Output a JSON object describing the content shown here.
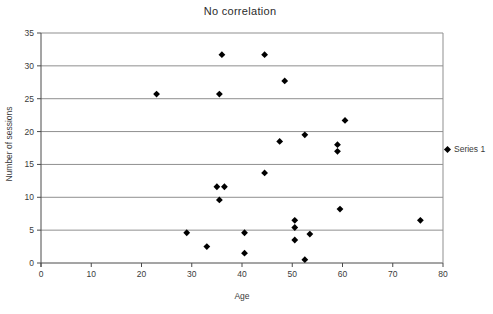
{
  "title": "No correlation",
  "legend": {
    "items": [
      {
        "label": "Series 1",
        "marker": "diamond-icon",
        "color": "#000000"
      }
    ]
  },
  "chart_data": {
    "type": "scatter",
    "title": "No correlation",
    "xlabel": "Age",
    "ylabel": "Number of sessions",
    "xlim": [
      0,
      80
    ],
    "ylim": [
      0,
      35
    ],
    "x_ticks": [
      0,
      10,
      20,
      30,
      40,
      50,
      60,
      70,
      80
    ],
    "y_ticks": [
      0,
      5,
      10,
      15,
      20,
      25,
      30,
      35
    ],
    "grid": "horizontal-gridlines",
    "legend_position": "right",
    "colors": {
      "marker": "#000000",
      "gridline": "#8f8f8f",
      "axis": "#4a4a4a",
      "text": "#3a3a3a",
      "background": "#ffffff"
    },
    "series": [
      {
        "name": "Series 1",
        "marker": "diamond",
        "color": "#000000",
        "points": [
          [
            36,
            31.7
          ],
          [
            44.5,
            31.7
          ],
          [
            48.5,
            27.7
          ],
          [
            23,
            25.7
          ],
          [
            35.5,
            25.7
          ],
          [
            60.5,
            21.7
          ],
          [
            52.5,
            19.5
          ],
          [
            47.5,
            18.5
          ],
          [
            59,
            18
          ],
          [
            59,
            17
          ],
          [
            44.5,
            13.7
          ],
          [
            35,
            11.6
          ],
          [
            36.5,
            11.6
          ],
          [
            35.5,
            9.6
          ],
          [
            59.5,
            8.2
          ],
          [
            50.5,
            6.5
          ],
          [
            75.5,
            6.5
          ],
          [
            50.5,
            5.4
          ],
          [
            29,
            4.6
          ],
          [
            40.5,
            4.6
          ],
          [
            53.5,
            4.4
          ],
          [
            50.5,
            3.5
          ],
          [
            33,
            2.5
          ],
          [
            40.5,
            1.5
          ],
          [
            52.5,
            0.5
          ]
        ]
      }
    ]
  }
}
